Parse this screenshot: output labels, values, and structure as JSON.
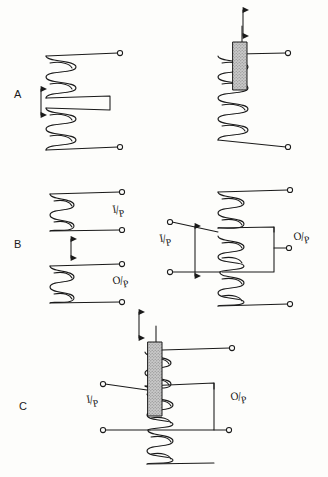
{
  "figure": {
    "background_color": "#fdfdfb",
    "ink_color": "#1a1a1a",
    "core_fill_color": "#c9c9c9",
    "rows": [
      {
        "id": "A",
        "label": "A",
        "caption": "Variable inductance",
        "panels": [
          {
            "id": "A-left",
            "type": "spaced-coil-pair",
            "movable_indicator": "double-headed-vertical-arrow",
            "terminals": 2,
            "port_labels": []
          },
          {
            "id": "A-right",
            "type": "coil-with-movable-core",
            "movable_indicator": "double-headed-vertical-arrow",
            "core": "ferrite-slug",
            "terminals": 2,
            "port_labels": []
          }
        ]
      },
      {
        "id": "B",
        "label": "B",
        "caption": "Variable coupling",
        "panels": [
          {
            "id": "B-left",
            "type": "two-separate-coils",
            "movable_indicator": "double-headed-vertical-arrow",
            "terminals": 4,
            "port_labels": [
              "I/P",
              "O/P"
            ]
          },
          {
            "id": "B-right",
            "type": "tapped-coil-sliding-link",
            "movable_indicator": "double-headed-vertical-arrow",
            "terminals": 5,
            "port_labels": [
              "I/P",
              "O/P"
            ]
          }
        ]
      },
      {
        "id": "C",
        "label": "C",
        "caption": "Variable inductance and coupling combined",
        "panels": [
          {
            "id": "C-center",
            "type": "tapped-coil-with-movable-core",
            "movable_indicator": "double-headed-vertical-arrow",
            "core": "ferrite-slug",
            "terminals": 5,
            "port_labels": [
              "I/P",
              "O/P"
            ]
          }
        ]
      }
    ],
    "port_label_text": {
      "input_top": "I",
      "input_slash": "/",
      "input_bottom": "P",
      "output_top": "O",
      "output_slash": "/",
      "output_bottom": "P"
    }
  }
}
